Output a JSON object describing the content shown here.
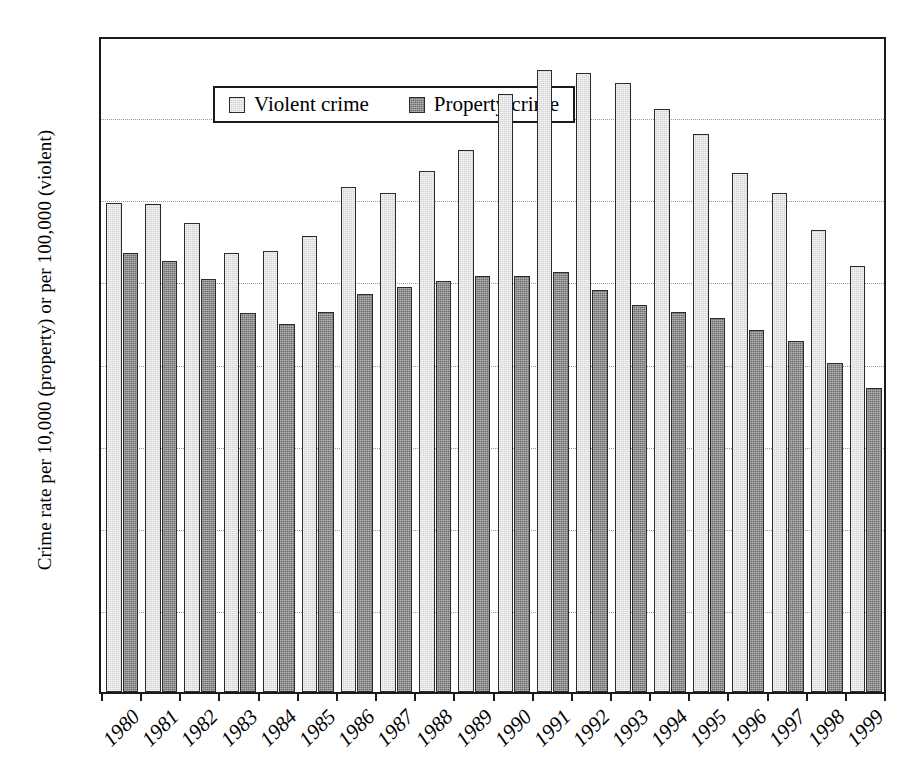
{
  "chart_data": {
    "type": "bar",
    "title": "",
    "subtitle": "",
    "xlabel": "",
    "ylabel": "Crime rate per 10,000 (property) or per 100,000 (violent)",
    "ylim": [
      0,
      800
    ],
    "ytick_step": 100,
    "yticks": [
      "0",
      "100",
      "200",
      "300",
      "400",
      "500",
      "600",
      "700",
      "800"
    ],
    "grid": true,
    "grid_axis": "y",
    "legend_position": "top-left-inside",
    "categories": [
      "1980",
      "1981",
      "1982",
      "1983",
      "1984",
      "1985",
      "1986",
      "1987",
      "1988",
      "1989",
      "1990",
      "1991",
      "1992",
      "1993",
      "1994",
      "1995",
      "1996",
      "1997",
      "1998",
      "1999"
    ],
    "series": [
      {
        "name": "Violent crime",
        "color": "#d2d2d2",
        "values": [
          596,
          594,
          571,
          535,
          537,
          555,
          615,
          608,
          635,
          660,
          728,
          757,
          754,
          742,
          710,
          680,
          632,
          608,
          563,
          519
        ]
      },
      {
        "name": "Property crime",
        "color": "#6e6e6e",
        "values": [
          534,
          525,
          503,
          462,
          448,
          463,
          485,
          493,
          501,
          506,
          506,
          511,
          489,
          471,
          463,
          455,
          441,
          428,
          401,
          370
        ]
      }
    ]
  },
  "legend": {
    "items": [
      {
        "label": "Violent crime",
        "swatch": "violent"
      },
      {
        "label": "Property crime",
        "swatch": "property"
      }
    ]
  }
}
